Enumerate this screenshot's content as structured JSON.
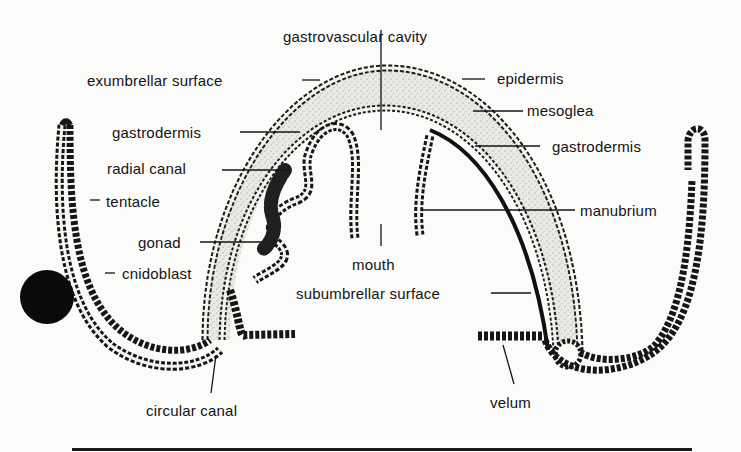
{
  "figure": {
    "labels": {
      "gastrovascular_cavity": "gastrovascular cavity",
      "exumbrellar_surface": "exumbrellar surface",
      "epidermis": "epidermis",
      "mesoglea": "mesoglea",
      "gastrodermis_left": "gastrodermis",
      "gastrodermis_right": "gastrodermis",
      "radial_canal": "radial canal",
      "tentacle": "tentacle",
      "manubrium": "manubrium",
      "gonad": "gonad",
      "cnidoblast": "cnidoblast",
      "mouth": "mouth",
      "subumbrellar_surface": "subumbrellar surface",
      "circular_canal": "circular canal",
      "velum": "velum"
    },
    "colors": {
      "ink": "#141414",
      "background": "#fbfbfa",
      "mesoglea_fill": "#e4e2dc",
      "cell_fill": "#f4f3ef"
    }
  }
}
